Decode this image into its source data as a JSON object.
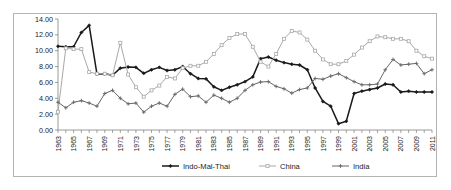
{
  "chart_data": {
    "type": "line",
    "title": "",
    "subtitle": "",
    "xlabel": "",
    "ylabel": "",
    "ylim": [
      0.0,
      14.0
    ],
    "ytick_step": 2.0,
    "ytick_labels": [
      "0.00",
      "2.00",
      "4.00",
      "6.00",
      "8.00",
      "10.00",
      "12.00",
      "14.00"
    ],
    "grid": false,
    "legend_position": "bottom",
    "x": [
      1963,
      1964,
      1965,
      1966,
      1967,
      1968,
      1969,
      1970,
      1971,
      1972,
      1973,
      1974,
      1975,
      1976,
      1977,
      1978,
      1979,
      1980,
      1981,
      1982,
      1983,
      1984,
      1985,
      1986,
      1987,
      1988,
      1989,
      1990,
      1991,
      1992,
      1993,
      1994,
      1995,
      1996,
      1997,
      1998,
      1999,
      2000,
      2001,
      2002,
      2003,
      2004,
      2005,
      2006,
      2007,
      2008,
      2009,
      2010,
      2011
    ],
    "xtick_labels": [
      "1963",
      "1965",
      "1967",
      "1969",
      "1971",
      "1973",
      "1975",
      "1977",
      "1979",
      "1981",
      "1983",
      "1985",
      "1987",
      "1989",
      "1991",
      "1993",
      "1995",
      "1997",
      "1999",
      "2001",
      "2003",
      "2005",
      "2007",
      "2009",
      "2011"
    ],
    "xtick_interval": 2,
    "series": [
      {
        "name": "Indo-Mal-Thai",
        "color": "#1a1a1a",
        "marker": "diamond",
        "values": [
          10.55,
          10.5,
          10.5,
          12.3,
          13.2,
          7.05,
          7.1,
          6.9,
          7.8,
          7.95,
          7.9,
          7.15,
          7.6,
          7.9,
          7.5,
          7.6,
          8.0,
          7.1,
          6.5,
          6.45,
          5.45,
          5.0,
          5.4,
          5.7,
          6.1,
          6.7,
          9.0,
          9.2,
          8.8,
          8.5,
          8.3,
          8.2,
          7.6,
          5.3,
          3.6,
          3.0,
          0.8,
          1.1,
          4.6,
          4.9,
          5.1,
          5.3,
          5.8,
          5.7,
          4.8,
          4.9,
          4.8,
          4.8,
          4.8
        ]
      },
      {
        "name": "China",
        "color": "#a8a8a8",
        "marker": "square",
        "values": [
          2.3,
          10.3,
          10.2,
          10.2,
          7.3,
          7.1,
          7.1,
          6.9,
          11.0,
          7.0,
          5.4,
          4.2,
          5.0,
          5.6,
          6.7,
          6.5,
          7.8,
          8.1,
          8.1,
          8.6,
          9.6,
          10.7,
          11.6,
          12.1,
          12.1,
          10.5,
          8.6,
          8.0,
          9.6,
          11.5,
          12.5,
          12.3,
          11.4,
          10.0,
          8.9,
          8.3,
          8.3,
          8.7,
          9.5,
          10.4,
          11.2,
          11.8,
          11.7,
          11.5,
          11.5,
          11.2,
          10.0,
          9.3,
          9.0
        ]
      },
      {
        "name": "India",
        "color": "#666666",
        "marker": "cross",
        "values": [
          3.5,
          2.8,
          3.5,
          3.7,
          3.4,
          3.0,
          4.6,
          5.0,
          4.0,
          3.3,
          3.4,
          2.25,
          3.0,
          3.4,
          3.0,
          4.5,
          5.15,
          4.2,
          4.3,
          3.5,
          4.4,
          4.0,
          3.5,
          4.0,
          5.0,
          5.7,
          6.05,
          6.1,
          5.5,
          5.2,
          4.65,
          5.1,
          5.3,
          6.5,
          6.4,
          6.8,
          7.1,
          6.6,
          6.1,
          5.7,
          5.7,
          5.8,
          7.6,
          8.9,
          8.2,
          8.3,
          8.4,
          7.1,
          7.6
        ]
      }
    ]
  },
  "legend": {
    "items": [
      {
        "label": "Indo-Mal-Thai",
        "color": "#1a1a1a"
      },
      {
        "label": "China",
        "color": "#a8a8a8"
      },
      {
        "label": "India",
        "color": "#666666"
      }
    ]
  }
}
